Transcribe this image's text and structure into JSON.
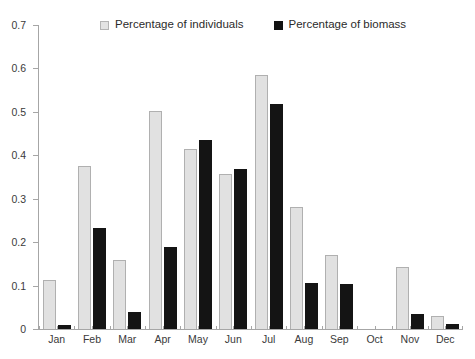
{
  "chart_data": {
    "type": "bar",
    "title": "",
    "subtitle": "",
    "xlabel": "",
    "ylabel": "",
    "ylim": [
      0,
      0.7
    ],
    "ytick_labels": [
      "0.7",
      "0.6",
      "0.5",
      "0.4",
      "0.3",
      "0.2",
      "0.1",
      "0"
    ],
    "ytick_values": [
      0.7,
      0.6,
      0.5,
      0.4,
      0.3,
      0.2,
      0.1,
      0
    ],
    "grid": false,
    "legend_position": "top-center",
    "categories": [
      "Jan",
      "Feb",
      "Mar",
      "Apr",
      "May",
      "Jun",
      "Jul",
      "Aug",
      "Sep",
      "Oct",
      "Nov",
      "Dec"
    ],
    "series": [
      {
        "name": "Percentage of individuals",
        "color": "#e1e1e1",
        "edge_color": "#b0b0b0",
        "values": [
          0.112,
          0.376,
          0.158,
          0.501,
          0.415,
          0.358,
          0.586,
          0.281,
          0.17,
          0.0,
          0.143,
          0.031
        ]
      },
      {
        "name": "Percentage of biomass",
        "color": "#141414",
        "edge_color": "#141414",
        "values": [
          0.009,
          0.232,
          0.039,
          0.188,
          0.435,
          0.368,
          0.519,
          0.107,
          0.103,
          0.0,
          0.035,
          0.011
        ]
      }
    ]
  },
  "legend": {
    "entries": [
      {
        "label": "Percentage of individuals",
        "marker": "open-square-icon"
      },
      {
        "label": "Percentage of biomass",
        "marker": "filled-square-icon"
      }
    ]
  }
}
